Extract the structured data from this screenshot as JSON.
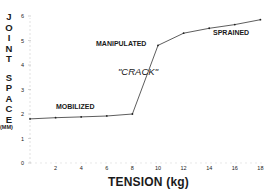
{
  "chart_data": {
    "type": "line",
    "title": "",
    "xlabel": "TENSION (kg)",
    "ylabel": "JOINT SPACE (MM)",
    "xlim": [
      0,
      18
    ],
    "ylim": [
      0,
      6
    ],
    "x_ticks": [
      2,
      4,
      6,
      8,
      10,
      12,
      14,
      16,
      18
    ],
    "y_ticks": [
      0,
      1,
      2,
      3,
      4,
      5,
      6
    ],
    "grid": false,
    "legend": null,
    "series": [
      {
        "name": "Joint space",
        "x": [
          0,
          2,
          4,
          6,
          8,
          10,
          12,
          14,
          16,
          18
        ],
        "y": [
          1.8,
          1.85,
          1.88,
          1.92,
          2.0,
          4.8,
          5.3,
          5.5,
          5.65,
          5.85
        ]
      }
    ],
    "annotations": [
      {
        "text": "MOBILIZED",
        "x": 4,
        "y": 2.15
      },
      {
        "text": "MANIPULATED",
        "x": 9.5,
        "y": 5.0
      },
      {
        "text": "\"CRACK\"",
        "x": 9.5,
        "y": 3.7,
        "style": "italic"
      },
      {
        "text": "SPRAINED",
        "x": 15,
        "y": 5.3
      }
    ]
  },
  "labels": {
    "ylabel_letters_1": [
      "J",
      "O",
      "I",
      "N",
      "T"
    ],
    "ylabel_letters_2": [
      "S",
      "P",
      "A",
      "C",
      "E"
    ],
    "ylabel_unit": "(MM)",
    "xlabel": "TENSION (kg)",
    "mobilized": "MOBILIZED",
    "manipulated": "MANIPULATED",
    "crack": "\"CRACK\"",
    "sprained": "SPRAINED",
    "y_tick_labels": [
      "0",
      "1",
      "2",
      "3",
      "4",
      "5",
      "6"
    ],
    "x_tick_labels": [
      "2",
      "4",
      "6",
      "8",
      "10",
      "12",
      "14",
      "16",
      "18"
    ]
  }
}
